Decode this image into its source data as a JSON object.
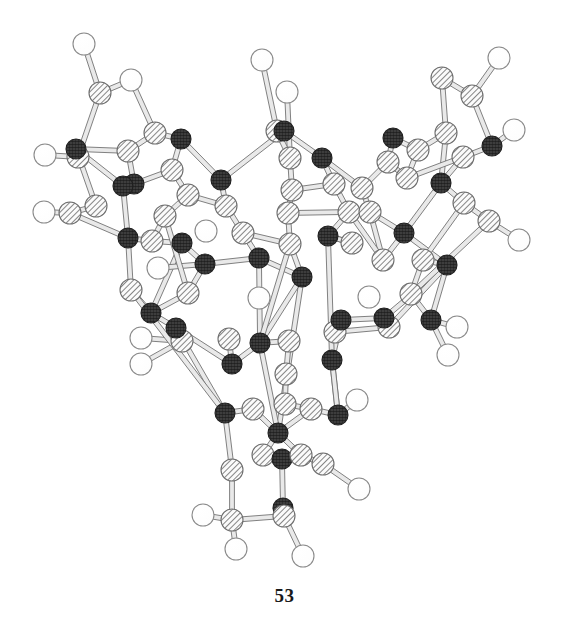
{
  "figure": {
    "caption": "53",
    "background_color": "#ffffff",
    "width": 569,
    "height": 635,
    "kind": "molecular-structure-diagram",
    "style": "ball-and-stick ORTEP crystallographic rendering"
  },
  "legend": {
    "atom_types": [
      {
        "key": "open",
        "label": "open-circle-atom",
        "fill": "#ffffff",
        "stroke": "#8a8a8a",
        "radius": 11
      },
      {
        "key": "hatch",
        "label": "diagonal-hatched-atom",
        "fill": "#f2f2f2",
        "stroke": "#6e6e6e",
        "radius": 11
      },
      {
        "key": "dark",
        "label": "dark-crosshatched-atom",
        "fill": "#4a4a4a",
        "stroke": "#1f1f1f",
        "radius": 10
      }
    ],
    "bond_color": "#9a9a9a",
    "bond_edge_color": "#6b6b6b"
  },
  "chart_data": {
    "type": "scatter",
    "title": "53",
    "xlabel": "",
    "ylabel": "",
    "xlim": [
      0,
      569
    ],
    "ylim": [
      0,
      600
    ],
    "grid": false,
    "legend_position": "none",
    "atoms": [
      {
        "id": 0,
        "x": 84,
        "y": 44,
        "t": "open"
      },
      {
        "id": 1,
        "x": 100,
        "y": 93,
        "t": "hatch"
      },
      {
        "id": 2,
        "x": 131,
        "y": 80,
        "t": "open"
      },
      {
        "id": 3,
        "x": 155,
        "y": 133,
        "t": "hatch"
      },
      {
        "id": 4,
        "x": 78,
        "y": 157,
        "t": "hatch"
      },
      {
        "id": 5,
        "x": 45,
        "y": 155,
        "t": "open"
      },
      {
        "id": 6,
        "x": 76,
        "y": 149,
        "t": "dark"
      },
      {
        "id": 7,
        "x": 128,
        "y": 151,
        "t": "hatch"
      },
      {
        "id": 8,
        "x": 134,
        "y": 184,
        "t": "dark"
      },
      {
        "id": 9,
        "x": 96,
        "y": 206,
        "t": "hatch"
      },
      {
        "id": 10,
        "x": 70,
        "y": 213,
        "t": "hatch"
      },
      {
        "id": 11,
        "x": 44,
        "y": 212,
        "t": "open"
      },
      {
        "id": 12,
        "x": 123,
        "y": 186,
        "t": "dark"
      },
      {
        "id": 13,
        "x": 128,
        "y": 238,
        "t": "dark"
      },
      {
        "id": 14,
        "x": 181,
        "y": 139,
        "t": "dark"
      },
      {
        "id": 15,
        "x": 172,
        "y": 170,
        "t": "hatch"
      },
      {
        "id": 16,
        "x": 188,
        "y": 195,
        "t": "hatch"
      },
      {
        "id": 17,
        "x": 165,
        "y": 216,
        "t": "hatch"
      },
      {
        "id": 18,
        "x": 152,
        "y": 241,
        "t": "hatch"
      },
      {
        "id": 19,
        "x": 182,
        "y": 243,
        "t": "dark"
      },
      {
        "id": 20,
        "x": 158,
        "y": 268,
        "t": "open"
      },
      {
        "id": 21,
        "x": 131,
        "y": 290,
        "t": "hatch"
      },
      {
        "id": 22,
        "x": 151,
        "y": 313,
        "t": "dark"
      },
      {
        "id": 23,
        "x": 188,
        "y": 293,
        "t": "hatch"
      },
      {
        "id": 24,
        "x": 205,
        "y": 264,
        "t": "dark"
      },
      {
        "id": 25,
        "x": 221,
        "y": 180,
        "t": "dark"
      },
      {
        "id": 26,
        "x": 226,
        "y": 206,
        "t": "hatch"
      },
      {
        "id": 27,
        "x": 243,
        "y": 233,
        "t": "hatch"
      },
      {
        "id": 28,
        "x": 259,
        "y": 258,
        "t": "dark"
      },
      {
        "id": 29,
        "x": 262,
        "y": 60,
        "t": "open"
      },
      {
        "id": 30,
        "x": 287,
        "y": 92,
        "t": "open"
      },
      {
        "id": 31,
        "x": 277,
        "y": 131,
        "t": "hatch"
      },
      {
        "id": 32,
        "x": 290,
        "y": 158,
        "t": "hatch"
      },
      {
        "id": 33,
        "x": 284,
        "y": 131,
        "t": "dark"
      },
      {
        "id": 34,
        "x": 292,
        "y": 190,
        "t": "hatch"
      },
      {
        "id": 35,
        "x": 288,
        "y": 213,
        "t": "hatch"
      },
      {
        "id": 36,
        "x": 290,
        "y": 244,
        "t": "hatch"
      },
      {
        "id": 37,
        "x": 302,
        "y": 277,
        "t": "dark"
      },
      {
        "id": 38,
        "x": 322,
        "y": 158,
        "t": "dark"
      },
      {
        "id": 39,
        "x": 334,
        "y": 184,
        "t": "hatch"
      },
      {
        "id": 40,
        "x": 349,
        "y": 212,
        "t": "hatch"
      },
      {
        "id": 41,
        "x": 328,
        "y": 236,
        "t": "dark"
      },
      {
        "id": 42,
        "x": 352,
        "y": 243,
        "t": "hatch"
      },
      {
        "id": 43,
        "x": 362,
        "y": 188,
        "t": "hatch"
      },
      {
        "id": 44,
        "x": 388,
        "y": 162,
        "t": "hatch"
      },
      {
        "id": 45,
        "x": 393,
        "y": 138,
        "t": "dark"
      },
      {
        "id": 46,
        "x": 370,
        "y": 212,
        "t": "hatch"
      },
      {
        "id": 47,
        "x": 383,
        "y": 260,
        "t": "hatch"
      },
      {
        "id": 48,
        "x": 404,
        "y": 233,
        "t": "dark"
      },
      {
        "id": 49,
        "x": 407,
        "y": 178,
        "t": "hatch"
      },
      {
        "id": 50,
        "x": 418,
        "y": 150,
        "t": "hatch"
      },
      {
        "id": 51,
        "x": 446,
        "y": 133,
        "t": "hatch"
      },
      {
        "id": 52,
        "x": 442,
        "y": 78,
        "t": "hatch"
      },
      {
        "id": 53,
        "x": 472,
        "y": 96,
        "t": "hatch"
      },
      {
        "id": 54,
        "x": 499,
        "y": 58,
        "t": "open"
      },
      {
        "id": 55,
        "x": 514,
        "y": 130,
        "t": "open"
      },
      {
        "id": 56,
        "x": 492,
        "y": 146,
        "t": "dark"
      },
      {
        "id": 57,
        "x": 463,
        "y": 157,
        "t": "hatch"
      },
      {
        "id": 58,
        "x": 441,
        "y": 183,
        "t": "dark"
      },
      {
        "id": 59,
        "x": 464,
        "y": 203,
        "t": "hatch"
      },
      {
        "id": 60,
        "x": 489,
        "y": 221,
        "t": "hatch"
      },
      {
        "id": 61,
        "x": 519,
        "y": 240,
        "t": "open"
      },
      {
        "id": 62,
        "x": 423,
        "y": 260,
        "t": "hatch"
      },
      {
        "id": 63,
        "x": 447,
        "y": 265,
        "t": "dark"
      },
      {
        "id": 64,
        "x": 411,
        "y": 294,
        "t": "hatch"
      },
      {
        "id": 65,
        "x": 431,
        "y": 320,
        "t": "dark"
      },
      {
        "id": 66,
        "x": 457,
        "y": 327,
        "t": "open"
      },
      {
        "id": 67,
        "x": 448,
        "y": 355,
        "t": "open"
      },
      {
        "id": 68,
        "x": 141,
        "y": 338,
        "t": "open"
      },
      {
        "id": 69,
        "x": 141,
        "y": 364,
        "t": "open"
      },
      {
        "id": 70,
        "x": 182,
        "y": 341,
        "t": "hatch"
      },
      {
        "id": 71,
        "x": 176,
        "y": 328,
        "t": "dark"
      },
      {
        "id": 72,
        "x": 229,
        "y": 339,
        "t": "hatch"
      },
      {
        "id": 73,
        "x": 232,
        "y": 364,
        "t": "dark"
      },
      {
        "id": 74,
        "x": 260,
        "y": 343,
        "t": "dark"
      },
      {
        "id": 75,
        "x": 289,
        "y": 341,
        "t": "hatch"
      },
      {
        "id": 76,
        "x": 286,
        "y": 374,
        "t": "hatch"
      },
      {
        "id": 77,
        "x": 285,
        "y": 404,
        "t": "hatch"
      },
      {
        "id": 78,
        "x": 335,
        "y": 332,
        "t": "hatch"
      },
      {
        "id": 79,
        "x": 332,
        "y": 360,
        "t": "dark"
      },
      {
        "id": 80,
        "x": 341,
        "y": 320,
        "t": "dark"
      },
      {
        "id": 81,
        "x": 389,
        "y": 327,
        "t": "hatch"
      },
      {
        "id": 82,
        "x": 384,
        "y": 318,
        "t": "dark"
      },
      {
        "id": 83,
        "x": 311,
        "y": 409,
        "t": "hatch"
      },
      {
        "id": 84,
        "x": 225,
        "y": 413,
        "t": "dark"
      },
      {
        "id": 85,
        "x": 253,
        "y": 409,
        "t": "hatch"
      },
      {
        "id": 86,
        "x": 338,
        "y": 415,
        "t": "dark"
      },
      {
        "id": 87,
        "x": 278,
        "y": 433,
        "t": "dark"
      },
      {
        "id": 88,
        "x": 263,
        "y": 455,
        "t": "hatch"
      },
      {
        "id": 89,
        "x": 282,
        "y": 459,
        "t": "dark"
      },
      {
        "id": 90,
        "x": 301,
        "y": 455,
        "t": "hatch"
      },
      {
        "id": 91,
        "x": 323,
        "y": 464,
        "t": "hatch"
      },
      {
        "id": 92,
        "x": 232,
        "y": 470,
        "t": "hatch"
      },
      {
        "id": 93,
        "x": 359,
        "y": 489,
        "t": "open"
      },
      {
        "id": 94,
        "x": 283,
        "y": 508,
        "t": "dark"
      },
      {
        "id": 95,
        "x": 284,
        "y": 516,
        "t": "hatch"
      },
      {
        "id": 96,
        "x": 232,
        "y": 520,
        "t": "hatch"
      },
      {
        "id": 97,
        "x": 203,
        "y": 515,
        "t": "open"
      },
      {
        "id": 98,
        "x": 236,
        "y": 549,
        "t": "open"
      },
      {
        "id": 99,
        "x": 303,
        "y": 556,
        "t": "open"
      },
      {
        "id": 100,
        "x": 357,
        "y": 400,
        "t": "open"
      },
      {
        "id": 101,
        "x": 206,
        "y": 231,
        "t": "open"
      },
      {
        "id": 102,
        "x": 259,
        "y": 298,
        "t": "open"
      },
      {
        "id": 103,
        "x": 369,
        "y": 297,
        "t": "open"
      }
    ],
    "bonds": [
      [
        0,
        1
      ],
      [
        1,
        2
      ],
      [
        1,
        4
      ],
      [
        2,
        3
      ],
      [
        3,
        14
      ],
      [
        3,
        7
      ],
      [
        4,
        5
      ],
      [
        4,
        6
      ],
      [
        6,
        7
      ],
      [
        6,
        12
      ],
      [
        6,
        9
      ],
      [
        7,
        8
      ],
      [
        8,
        12
      ],
      [
        8,
        15
      ],
      [
        9,
        10
      ],
      [
        10,
        11
      ],
      [
        10,
        13
      ],
      [
        12,
        13
      ],
      [
        13,
        18
      ],
      [
        13,
        21
      ],
      [
        14,
        15
      ],
      [
        14,
        25
      ],
      [
        15,
        16
      ],
      [
        16,
        17
      ],
      [
        17,
        18
      ],
      [
        18,
        19
      ],
      [
        19,
        24
      ],
      [
        19,
        22
      ],
      [
        20,
        24
      ],
      [
        21,
        22
      ],
      [
        22,
        23
      ],
      [
        23,
        24
      ],
      [
        24,
        28
      ],
      [
        25,
        26
      ],
      [
        26,
        27
      ],
      [
        27,
        28
      ],
      [
        25,
        33
      ],
      [
        29,
        31
      ],
      [
        30,
        32
      ],
      [
        31,
        32
      ],
      [
        31,
        33
      ],
      [
        32,
        34
      ],
      [
        33,
        38
      ],
      [
        34,
        35
      ],
      [
        35,
        36
      ],
      [
        36,
        37
      ],
      [
        28,
        37
      ],
      [
        37,
        87
      ],
      [
        38,
        39
      ],
      [
        39,
        40
      ],
      [
        40,
        41
      ],
      [
        41,
        42
      ],
      [
        38,
        43
      ],
      [
        43,
        44
      ],
      [
        44,
        45
      ],
      [
        44,
        49
      ],
      [
        45,
        50
      ],
      [
        46,
        48
      ],
      [
        47,
        48
      ],
      [
        48,
        63
      ],
      [
        49,
        50
      ],
      [
        50,
        51
      ],
      [
        51,
        52
      ],
      [
        52,
        53
      ],
      [
        53,
        54
      ],
      [
        53,
        56
      ],
      [
        56,
        55
      ],
      [
        56,
        57
      ],
      [
        57,
        58
      ],
      [
        58,
        59
      ],
      [
        59,
        60
      ],
      [
        60,
        61
      ],
      [
        58,
        48
      ],
      [
        62,
        63
      ],
      [
        63,
        65
      ],
      [
        64,
        65
      ],
      [
        65,
        66
      ],
      [
        65,
        67
      ],
      [
        51,
        58
      ],
      [
        57,
        49
      ],
      [
        43,
        46
      ],
      [
        46,
        47
      ],
      [
        42,
        41
      ],
      [
        68,
        70
      ],
      [
        69,
        70
      ],
      [
        70,
        71
      ],
      [
        71,
        73
      ],
      [
        72,
        73
      ],
      [
        73,
        74
      ],
      [
        74,
        75
      ],
      [
        75,
        76
      ],
      [
        76,
        77
      ],
      [
        77,
        83
      ],
      [
        78,
        79
      ],
      [
        79,
        80
      ],
      [
        80,
        82
      ],
      [
        81,
        82
      ],
      [
        82,
        63
      ],
      [
        78,
        81
      ],
      [
        84,
        85
      ],
      [
        85,
        87
      ],
      [
        83,
        86
      ],
      [
        86,
        79
      ],
      [
        84,
        71
      ],
      [
        84,
        92
      ],
      [
        87,
        88
      ],
      [
        87,
        90
      ],
      [
        88,
        89
      ],
      [
        89,
        90
      ],
      [
        89,
        94
      ],
      [
        90,
        91
      ],
      [
        91,
        93
      ],
      [
        92,
        96
      ],
      [
        94,
        95
      ],
      [
        95,
        96
      ],
      [
        96,
        97
      ],
      [
        96,
        98
      ],
      [
        95,
        99
      ],
      [
        86,
        100
      ],
      [
        87,
        83
      ],
      [
        74,
        87
      ],
      [
        79,
        86
      ],
      [
        21,
        84
      ],
      [
        22,
        71
      ],
      [
        41,
        79
      ],
      [
        37,
        74
      ],
      [
        28,
        74
      ],
      [
        36,
        74
      ],
      [
        63,
        81
      ],
      [
        62,
        64
      ],
      [
        16,
        26
      ],
      [
        34,
        39
      ],
      [
        35,
        40
      ],
      [
        27,
        36
      ],
      [
        40,
        47
      ],
      [
        17,
        23
      ],
      [
        59,
        62
      ],
      [
        60,
        64
      ]
    ],
    "counts": {
      "open_circle_atoms": 22,
      "hatched_atoms": 44,
      "dark_atoms": 38,
      "total_atoms": 104,
      "bonds": 128
    }
  }
}
